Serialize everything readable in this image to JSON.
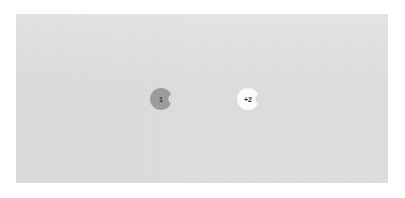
{
  "header": {
    "label": "Slide 1"
  },
  "canvas": {
    "background_color": "#dcdcdc",
    "page_background_color": "#ffffff"
  },
  "avatar_stack": {
    "name": "collaborator-avatars",
    "items": [
      {
        "id": "avatar-1",
        "label": "1",
        "fill_color": "#9c9c9c",
        "text_color": "#3c3c3c",
        "shape": "circle-with-right-notch"
      },
      {
        "id": "avatar-2",
        "label": "+2",
        "fill_color": "#fbfbfb",
        "text_color": "#2e2e2e",
        "shape": "circle-with-right-notch"
      }
    ]
  }
}
